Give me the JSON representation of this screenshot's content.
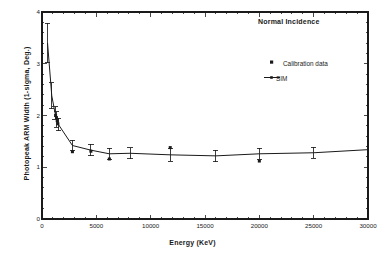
{
  "chart_data": {
    "type": "line",
    "title": "",
    "annotation": "Normal Incidence",
    "xlabel": "Energy (KeV)",
    "ylabel": "Photopeak  ARM  Width  (1-sigma,  Deg.)",
    "xlim": [
      0,
      30000
    ],
    "ylim": [
      0,
      4
    ],
    "xticks": [
      0,
      5000,
      10000,
      15000,
      20000,
      25000,
      30000
    ],
    "xticklabels": [
      "0",
      "5000",
      "10000",
      "15000",
      "20000",
      "25000",
      "30000"
    ],
    "yticks": [
      0,
      1,
      2,
      3,
      4
    ],
    "yticklabels": [
      "0",
      "1",
      "2",
      "3",
      "4"
    ],
    "xminor_step": 1000,
    "yminor_step": 0.2,
    "grid": false,
    "legend_position": "upper-right-inside",
    "legend": [
      {
        "name": "Calibration data",
        "marker": "square",
        "line": false
      },
      {
        "name": "SIM",
        "marker": "none",
        "line": true
      }
    ],
    "series": [
      {
        "name": "SIM",
        "style": "line-with-errorbars",
        "color": "#1a1a1a",
        "points": [
          {
            "x": 511,
            "y": 3.4,
            "yerr": 0.38
          },
          {
            "x": 900,
            "y": 2.38,
            "yerr": 0.25
          },
          {
            "x": 1200,
            "y": 2.05,
            "yerr": 0.12
          },
          {
            "x": 1330,
            "y": 1.92,
            "yerr": 0.15
          },
          {
            "x": 1500,
            "y": 1.83,
            "yerr": 0.12
          },
          {
            "x": 2800,
            "y": 1.42,
            "yerr": 0.1
          },
          {
            "x": 4500,
            "y": 1.33,
            "yerr": 0.11
          },
          {
            "x": 6200,
            "y": 1.26,
            "yerr": 0.11
          },
          {
            "x": 8100,
            "y": 1.27,
            "yerr": 0.11
          },
          {
            "x": 11800,
            "y": 1.24,
            "yerr": 0.12
          },
          {
            "x": 16000,
            "y": 1.22,
            "yerr": 0.11
          },
          {
            "x": 20000,
            "y": 1.26,
            "yerr": 0.11
          },
          {
            "x": 25000,
            "y": 1.28,
            "yerr": 0.11
          },
          {
            "x": 30000,
            "y": 1.34,
            "yerr": 0.0
          }
        ]
      },
      {
        "name": "Calibration data",
        "style": "scatter-square",
        "color": "#1a1a1a",
        "points": [
          {
            "x": 1250,
            "y": 2.0
          },
          {
            "x": 1330,
            "y": 1.96
          },
          {
            "x": 1400,
            "y": 1.9
          },
          {
            "x": 1460,
            "y": 1.84
          },
          {
            "x": 2800,
            "y": 1.3
          },
          {
            "x": 4500,
            "y": 1.31
          },
          {
            "x": 6200,
            "y": 1.16
          },
          {
            "x": 11800,
            "y": 1.38
          },
          {
            "x": 20000,
            "y": 1.12
          }
        ]
      }
    ]
  }
}
